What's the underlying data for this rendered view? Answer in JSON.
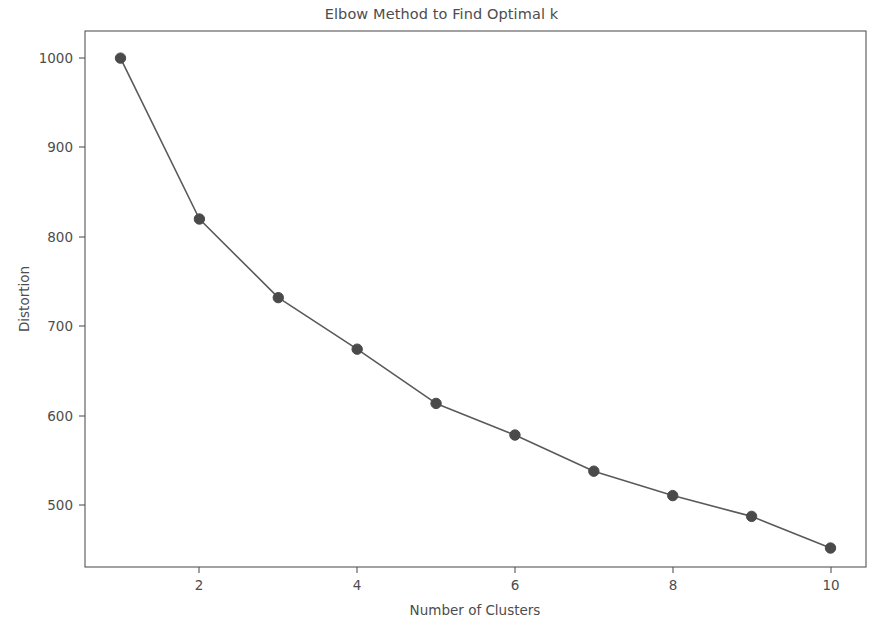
{
  "chart_data": {
    "type": "line",
    "title": "Elbow Method to Find Optimal k",
    "xlabel": "Number of Clusters",
    "ylabel": "Distortion",
    "x": [
      1,
      2,
      3,
      4,
      5,
      6,
      7,
      8,
      9,
      10
    ],
    "values": [
      1000,
      822,
      735,
      678,
      618,
      583,
      543,
      516,
      493,
      458
    ],
    "series": [
      {
        "name": "Distortion",
        "values": [
          1000,
          822,
          735,
          678,
          618,
          583,
          543,
          516,
          493,
          458
        ]
      }
    ],
    "xlim": [
      0.55,
      10.45
    ],
    "ylim": [
      437,
      1030
    ],
    "xticks": [
      2,
      4,
      6,
      8,
      10
    ],
    "xtick_labels": [
      "2",
      "4",
      "6",
      "8",
      "10"
    ],
    "yticks": [
      500,
      600,
      700,
      800,
      900,
      1000
    ],
    "ytick_labels": [
      "500",
      "600",
      "700",
      "800",
      "900",
      "1000"
    ],
    "grid": false,
    "legend": false,
    "legend_position": "none",
    "marker": "circle",
    "line_color": "#5a5a5a",
    "marker_color": "#4a4a4a",
    "background_color": "#ffffff",
    "text_color": "#4d4d4d"
  },
  "figure": {
    "title": "Elbow Method to Find Optimal k",
    "x_axis_title": "Number of Clusters",
    "y_axis_title": "Distortion"
  }
}
